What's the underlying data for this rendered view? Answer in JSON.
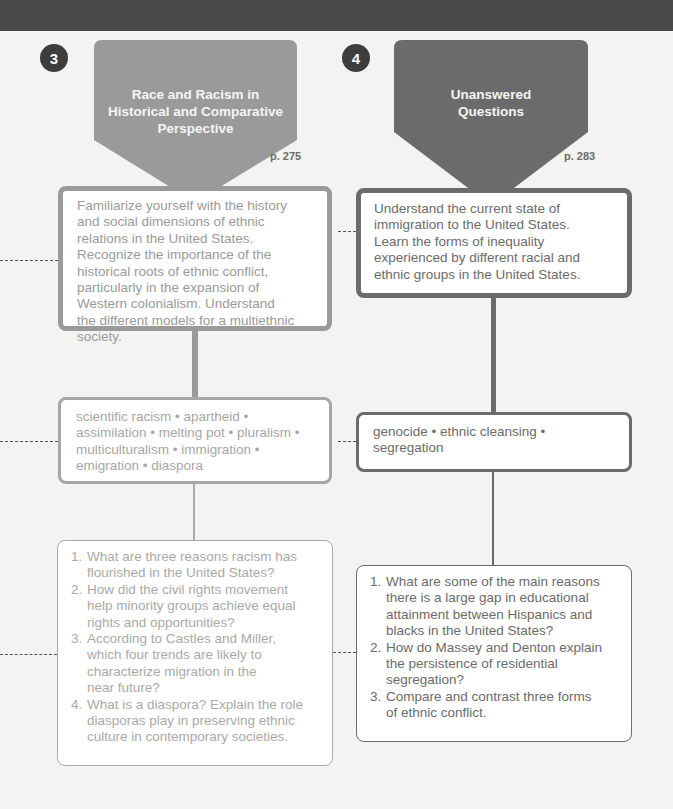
{
  "colors": {
    "col3_accent": "#999999",
    "col4_accent": "#6b6b6b",
    "background": "#f3f3f1",
    "top_bar": "#4a4a4a"
  },
  "columns": [
    {
      "number": "3",
      "title_lines": [
        "Race and Racism in",
        "Historical and Comparative",
        "Perspective"
      ],
      "page_ref": "p. 275",
      "objective": [
        "Familiarize yourself with the history",
        "and social dimensions of ethnic",
        "relations in the United States.",
        "Recognize the importance of the",
        "historical roots of ethnic conflict,",
        "particularly in the expansion of",
        "Western colonialism. Understand",
        "the different models for a multiethnic",
        "society."
      ],
      "key_terms": [
        "scientific racism • apartheid •",
        "assimilation • melting pot • pluralism •",
        "multiculturalism • immigration •",
        "emigration • diaspora"
      ],
      "questions": [
        {
          "num": "1.",
          "lines": [
            "What are three reasons racism has",
            "flourished in the United States?"
          ]
        },
        {
          "num": "2.",
          "lines": [
            "How did the civil rights movement",
            "help minority groups achieve equal",
            "rights and opportunities?"
          ]
        },
        {
          "num": "3.",
          "lines": [
            "According to Castles and Miller,",
            "which four trends are likely to",
            "characterize migration in the",
            "near future?"
          ]
        },
        {
          "num": "4.",
          "lines": [
            "What is a diaspora? Explain the role",
            "diasporas play in preserving ethnic",
            "culture in contemporary societies."
          ]
        }
      ]
    },
    {
      "number": "4",
      "title_lines": [
        "Unanswered",
        "Questions"
      ],
      "page_ref": "p. 283",
      "objective": [
        "Understand the current state of",
        "immigration to the United States.",
        "Learn the forms of inequality",
        "experienced by different racial and",
        "ethnic groups in the United States."
      ],
      "key_terms": [
        "genocide • ethnic cleansing •",
        "segregation"
      ],
      "questions": [
        {
          "num": "1.",
          "lines": [
            "What are some of the main reasons",
            "there is a large gap in educational",
            "attainment between Hispanics and",
            "blacks in the United States?"
          ]
        },
        {
          "num": "2.",
          "lines": [
            "How do Massey and Denton explain",
            "the persistence of residential",
            "segregation?"
          ]
        },
        {
          "num": "3.",
          "lines": [
            "Compare and contrast three forms",
            "of ethnic conflict."
          ]
        }
      ]
    }
  ]
}
